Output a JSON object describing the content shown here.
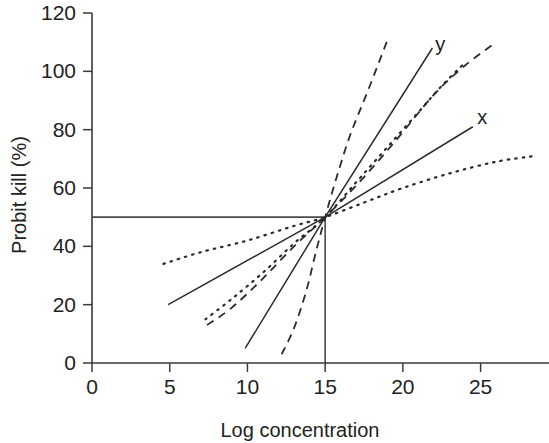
{
  "chart_data": {
    "type": "line",
    "title": "",
    "xlabel": "Log concentration",
    "ylabel": "Probit kill (%)",
    "xlim": [
      0,
      28.5
    ],
    "ylim": [
      0,
      120
    ],
    "grid": false,
    "legend_position": "inline-annotations",
    "xticks": [
      0,
      5,
      10,
      15,
      20,
      25
    ],
    "yticks": [
      0,
      20,
      40,
      60,
      80,
      100,
      120
    ],
    "xtick_labels": [
      "0",
      "5",
      "10",
      "15",
      "20",
      "25"
    ],
    "ytick_labels": [
      "0",
      "20",
      "40",
      "60",
      "80",
      "100",
      "120"
    ],
    "annotations": [
      {
        "text": "y",
        "x": 22.4,
        "y": 107,
        "note": "label for steep solid line"
      },
      {
        "text": "x",
        "x": 25.1,
        "y": 82,
        "note": "label for shallow solid line"
      }
    ],
    "reference_lines": [
      {
        "orientation": "horizontal",
        "value": 50,
        "from_x": 0,
        "to_x": 15,
        "note": "50% probit kill level"
      },
      {
        "orientation": "vertical",
        "value": 15,
        "from_y": 0,
        "to_y": 50,
        "note": "LC50 log concentration"
      }
    ],
    "intersection_point": {
      "x": 15,
      "y": 50
    },
    "series": [
      {
        "name": "y",
        "style": "solid",
        "note": "steep straight probit line, labelled y",
        "points": [
          [
            9.85,
            5
          ],
          [
            15,
            50
          ],
          [
            21.9,
            108
          ]
        ]
      },
      {
        "name": "x",
        "style": "solid",
        "note": "shallow straight probit line, labelled x",
        "points": [
          [
            4.9,
            20
          ],
          [
            15,
            50
          ],
          [
            24.5,
            81
          ]
        ]
      },
      {
        "name": "steep-sigmoid-dashed",
        "style": "dashed",
        "note": "steep sigmoid dose-response curve",
        "points": [
          [
            12.2,
            3
          ],
          [
            13.0,
            12
          ],
          [
            13.8,
            25
          ],
          [
            14.4,
            38
          ],
          [
            15,
            50
          ],
          [
            15.7,
            63
          ],
          [
            16.6,
            78
          ],
          [
            17.8,
            94
          ],
          [
            19.1,
            112
          ]
        ]
      },
      {
        "name": "broad-sigmoid-dashed",
        "style": "dashed",
        "note": "broad sigmoid dose-response curve rising to plateau",
        "points": [
          [
            7.4,
            13
          ],
          [
            9.0,
            19
          ],
          [
            11.0,
            29
          ],
          [
            13.0,
            40
          ],
          [
            15,
            50
          ],
          [
            17.2,
            62
          ],
          [
            19.5,
            76
          ],
          [
            22.0,
            92
          ],
          [
            24.0,
            102
          ],
          [
            26.0,
            110
          ]
        ]
      },
      {
        "name": "medium-sigmoid-dotted",
        "style": "dotted",
        "note": "intermediate dotted dose-response curve",
        "points": [
          [
            7.3,
            15
          ],
          [
            9.0,
            22
          ],
          [
            11.0,
            31
          ],
          [
            13.0,
            41
          ],
          [
            15,
            50
          ],
          [
            17.0,
            62
          ],
          [
            19.0,
            74
          ],
          [
            21.0,
            86
          ],
          [
            22.5,
            95
          ],
          [
            24.0,
            103
          ]
        ]
      },
      {
        "name": "shallow-sigmoid-dotted",
        "style": "dotted",
        "note": "shallow flat dotted dose-response curve",
        "points": [
          [
            4.6,
            34
          ],
          [
            7.0,
            38
          ],
          [
            10.0,
            42
          ],
          [
            13.0,
            47
          ],
          [
            15,
            50
          ],
          [
            17.5,
            55
          ],
          [
            20.0,
            60
          ],
          [
            23.0,
            65
          ],
          [
            26.0,
            69
          ],
          [
            28.5,
            71
          ]
        ]
      }
    ]
  }
}
